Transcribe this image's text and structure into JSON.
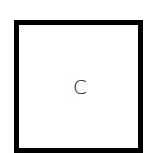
{
  "card": {
    "label": "C",
    "border_color": "#000000",
    "text_color": "#222222"
  }
}
